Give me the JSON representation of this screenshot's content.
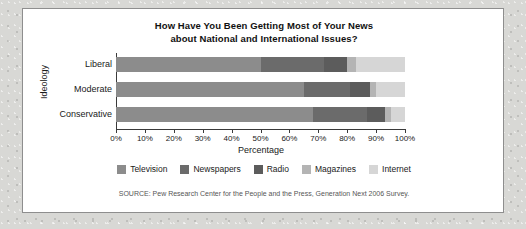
{
  "card": {
    "title_line1": "How Have You Been Getting Most of Your News",
    "title_line2": "about National and International Issues?",
    "source_note": "SOURCE: Pew Research Center for the People and the Press, Generation Next 2006 Survey."
  },
  "colors": {
    "television": "#8c8c8c",
    "newspapers": "#6b6b6b",
    "radio": "#5c5c5c",
    "magazines": "#b4b4b4",
    "internet": "#d6d6d6",
    "axis": "#3a3a3a",
    "card_background": "#ffffff",
    "page_background": "#d8d8d5",
    "text": "#1a1a1a"
  },
  "chart_data": {
    "type": "bar",
    "orientation": "horizontal",
    "stacked": true,
    "normalized": true,
    "title": "How Have You Been Getting Most of Your News about National and International Issues?",
    "xlabel": "Percentage",
    "ylabel": "Ideology",
    "xlim": [
      0,
      100
    ],
    "grid": false,
    "legend_position": "bottom",
    "categories": [
      "Liberal",
      "Moderate",
      "Conservative"
    ],
    "tick_labels": [
      "0%",
      "10%",
      "20%",
      "30%",
      "40%",
      "50%",
      "60%",
      "70%",
      "80%",
      "90%",
      "100%"
    ],
    "tick_values": [
      0,
      10,
      20,
      30,
      40,
      50,
      60,
      70,
      80,
      90,
      100
    ],
    "series": [
      {
        "name": "Television",
        "color_key": "television",
        "values": [
          50,
          65,
          68
        ]
      },
      {
        "name": "Newspapers",
        "color_key": "newspapers",
        "values": [
          22,
          16,
          19
        ]
      },
      {
        "name": "Radio",
        "color_key": "radio",
        "values": [
          8,
          7,
          6
        ]
      },
      {
        "name": "Magazines",
        "color_key": "magazines",
        "values": [
          3,
          2,
          2
        ]
      },
      {
        "name": "Internet",
        "color_key": "internet",
        "values": [
          17,
          10,
          5
        ]
      }
    ]
  }
}
